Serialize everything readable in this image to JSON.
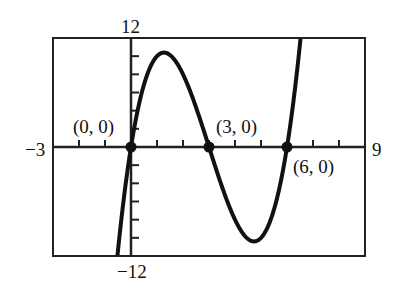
{
  "chart_data": {
    "type": "line",
    "title": "",
    "xlabel": "",
    "ylabel": "",
    "xlim": [
      -3,
      9
    ],
    "ylim": [
      -12,
      12
    ],
    "x_tick_step": 1,
    "y_tick_step": 2,
    "grid": false,
    "function": "f(x) = x(x - 3)(x - 6)",
    "series": [
      {
        "name": "f(x)",
        "x": [
          -0.7,
          -0.5,
          0,
          0.5,
          1,
          1.27,
          1.5,
          2,
          2.5,
          3,
          3.5,
          4,
          4.5,
          4.73,
          5,
          5.5,
          6,
          6.5,
          6.85
        ],
        "values": [
          -12.5,
          -11.4,
          0,
          6.9,
          10,
          10.4,
          10.1,
          8,
          4.4,
          0,
          -4.4,
          -8,
          -10.1,
          -10.4,
          -10,
          -6.9,
          0,
          11.4,
          17.4
        ]
      }
    ],
    "points": [
      {
        "x": 0,
        "y": 0,
        "label": "(0, 0)"
      },
      {
        "x": 3,
        "y": 0,
        "label": "(3, 0)"
      },
      {
        "x": 6,
        "y": 0,
        "label": "(6, 0)"
      }
    ],
    "window_labels": {
      "ymax": "12",
      "ymin": "-12",
      "xmin": "-3",
      "xmax": "9"
    }
  },
  "labels": {
    "ymax": "12",
    "ymin": "−12",
    "xmin": "−3",
    "xmax": "9",
    "p0": "(0, 0)",
    "p1": "(3, 0)",
    "p2": "(6, 0)"
  }
}
